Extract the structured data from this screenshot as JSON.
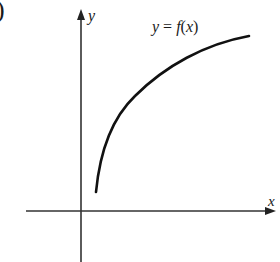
{
  "figure": {
    "paren_fragment": ")",
    "y_axis_label": "y",
    "x_axis_label": "x",
    "curve_label": {
      "y": "y",
      "eq": " = ",
      "f": "f",
      "open": "(",
      "x": "x",
      "close": ")"
    },
    "colors": {
      "ink": "#1a1a1a",
      "background": "#ffffff"
    }
  }
}
